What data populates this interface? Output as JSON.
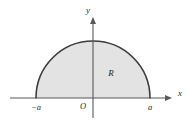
{
  "figure": {
    "background_color": "#ffffff"
  },
  "axes": {
    "x_axis": {
      "label": "x",
      "color": "#58595b",
      "start_x": 10,
      "end_x": 172,
      "y": 98,
      "arrow": "right",
      "label_x": 180,
      "label_y": 96
    },
    "y_axis": {
      "label": "y",
      "color": "#58595b",
      "x": 93,
      "start_y": 118,
      "end_y": 18,
      "arrow": "up",
      "label_x": 88,
      "label_y": 13
    },
    "origin": {
      "label": "O",
      "x": 83,
      "y": 109
    }
  },
  "ticks": [
    {
      "name": "left-endpoint",
      "label": "−a",
      "x": 36,
      "y": 110,
      "axis_x": 36
    },
    {
      "name": "right-endpoint",
      "label": "a",
      "x": 150,
      "y": 110,
      "axis_x": 150
    }
  ],
  "region": {
    "label": "R",
    "label_x": 111,
    "label_y": 76,
    "shape": "upper-half-disk",
    "center_x": 93,
    "center_y": 98,
    "radius": 57,
    "fill_color": "#e3e3e3",
    "stroke_color": "#3c3c3c",
    "stroke_width": 1.6
  },
  "chart_data": {
    "type": "scatter",
    "xlabel": "x",
    "ylabel": "y",
    "grid": false,
    "legend": null,
    "xlim": [
      -1.45,
      1.4
    ],
    "ylim": [
      -0.35,
      1.4
    ],
    "xticks": [
      -1,
      0,
      1
    ],
    "xtick_labels": [
      "−a",
      "O",
      "a"
    ],
    "yticks": [],
    "ytick_labels": [],
    "annotations": [
      {
        "text": "R",
        "x": 0.32,
        "y": 0.39
      }
    ],
    "shaded_regions": [
      {
        "name": "R",
        "description": "Semicircular region x^2 + y^2 <= a^2 with y >= 0",
        "center": [
          0,
          0
        ],
        "radius": 1,
        "angle_range_degrees": [
          0,
          180
        ],
        "fill": "#e3e3e3",
        "edge": "#3c3c3c"
      }
    ]
  }
}
